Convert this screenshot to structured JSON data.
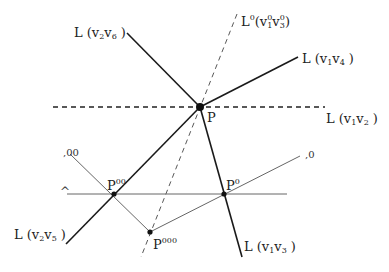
{
  "diagram": {
    "points": {
      "P": {
        "label": "P",
        "x": 200,
        "y": 107
      },
      "P00": {
        "label": "P",
        "sup": "00",
        "x": 114,
        "y": 194
      },
      "P0": {
        "label": "P",
        "sup": "0",
        "x": 224,
        "y": 194
      },
      "P000": {
        "label": "P",
        "sup": "000",
        "x": 150,
        "y": 232
      }
    },
    "lines": {
      "v2v6": {
        "label": "L (v",
        "s1": "2",
        "mid": "v",
        "s2": "6",
        "end": " )"
      },
      "v1v4": {
        "label": "L (v",
        "s1": "1",
        "mid": "v",
        "s2": "4",
        "end": " )"
      },
      "v1v2": {
        "label": "L (v",
        "s1": "1",
        "mid": "v",
        "s2": "2",
        "end": " )"
      },
      "v2v5": {
        "label": "L (v",
        "s1": "2",
        "mid": "v",
        "s2": "5",
        "end": " )"
      },
      "v1v3": {
        "label": "L (v",
        "s1": "1",
        "mid": "v",
        "s2": "3",
        "end": " )"
      },
      "L0": {
        "label": "L",
        "sup0": "0",
        "open": "(v",
        "s1": "1",
        "s1sup": "0",
        "mid": "v",
        "s2": "3",
        "s2sup": "0",
        "end": ")"
      }
    },
    "fragments": {
      "left_top": ",00",
      "left_mid": "̂",
      "right": ",0"
    },
    "colors": {
      "solid_line": "#1a1a1a",
      "thin_line": "#777777",
      "dashed_line": "#333333"
    }
  }
}
